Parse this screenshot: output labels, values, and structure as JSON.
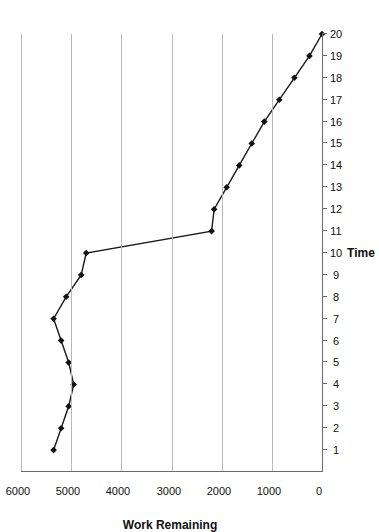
{
  "chart_data": {
    "type": "line",
    "title": "",
    "xlabel": "Time",
    "ylabel": "Work Remaining",
    "xlim": [
      0,
      20
    ],
    "ylim": [
      0,
      6000
    ],
    "xticks": [
      1,
      2,
      3,
      4,
      5,
      6,
      7,
      8,
      9,
      10,
      11,
      12,
      13,
      14,
      15,
      16,
      17,
      18,
      19,
      20
    ],
    "xtick_labels": [
      "1",
      "2",
      "3",
      "4",
      "5",
      "6",
      "7",
      "8",
      "9",
      "10",
      "11",
      "12",
      "13",
      "14",
      "15",
      "16",
      "17",
      "18",
      "19",
      "20"
    ],
    "yticks": [
      0,
      1000,
      2000,
      3000,
      4000,
      5000,
      6000
    ],
    "ytick_labels": [
      "0",
      "1000",
      "2000",
      "3000",
      "4000",
      "5000",
      "6000"
    ],
    "grid": true,
    "grid_axis": "y",
    "legend": false,
    "orientation": "rotated-90-ccw",
    "marker": "diamond",
    "line_color": "#1a1a1a",
    "marker_color": "#111111",
    "grid_color": "#b9b9b9",
    "axis_color": "#6b6b6b",
    "background": "#ffffff",
    "x": [
      1,
      2,
      3,
      4,
      5,
      6,
      7,
      8,
      9,
      10,
      11,
      12,
      13,
      14,
      15,
      16,
      17,
      18,
      19,
      20
    ],
    "values": [
      5350,
      5200,
      5050,
      4950,
      5050,
      5200,
      5350,
      5100,
      4800,
      4700,
      2200,
      2150,
      1900,
      1650,
      1400,
      1150,
      850,
      550,
      250,
      0
    ],
    "series": [
      {
        "name": "Work Remaining",
        "values": [
          5350,
          5200,
          5050,
          4950,
          5050,
          5200,
          5350,
          5100,
          4800,
          4700,
          2200,
          2150,
          1900,
          1650,
          1400,
          1150,
          850,
          550,
          250,
          0
        ]
      }
    ]
  }
}
